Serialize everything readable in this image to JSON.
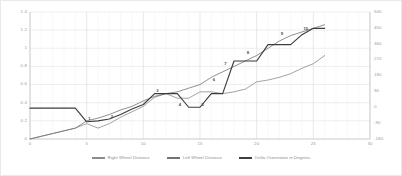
{
  "chart_data": {
    "type": "line",
    "title": "",
    "xlabel": "",
    "ylabel": "",
    "grid": true,
    "legend_position": "bottom",
    "xlim": [
      0,
      30
    ],
    "ylim": [
      0,
      1.4
    ],
    "y2lim": [
      -180,
      540
    ],
    "x_ticks": [
      "0",
      "5",
      "10",
      "15",
      "20",
      "25",
      "30"
    ],
    "y_ticks": [
      "0",
      "0.2",
      "0.4",
      "0.6",
      "0.8",
      "1",
      "1.2",
      "1.4"
    ],
    "y2_ticks": [
      "-180",
      "-90",
      "0",
      "90",
      "180",
      "270",
      "360",
      "450",
      "540"
    ],
    "x": [
      0,
      1,
      2,
      3,
      4,
      5,
      6,
      7,
      8,
      9,
      10,
      11,
      12,
      13,
      14,
      15,
      16,
      17,
      18,
      19,
      20,
      21,
      22,
      23,
      24,
      25,
      26
    ],
    "series": [
      {
        "name": "Right Wheel Distance",
        "color": "#8c8c8c",
        "axis": "left",
        "values": [
          0.0,
          0.03,
          0.06,
          0.09,
          0.12,
          0.17,
          0.12,
          0.17,
          0.24,
          0.3,
          0.36,
          0.46,
          0.5,
          0.45,
          0.45,
          0.52,
          0.52,
          0.5,
          0.52,
          0.55,
          0.63,
          0.65,
          0.68,
          0.72,
          0.78,
          0.83,
          0.92
        ]
      },
      {
        "name": "Left Wheel Distance",
        "color": "#737373",
        "axis": "left",
        "values": [
          0.0,
          0.03,
          0.06,
          0.09,
          0.12,
          0.2,
          0.23,
          0.27,
          0.32,
          0.36,
          0.42,
          0.47,
          0.5,
          0.52,
          0.56,
          0.6,
          0.68,
          0.74,
          0.8,
          0.86,
          0.92,
          1.0,
          1.08,
          1.14,
          1.18,
          1.22,
          1.26
        ]
      },
      {
        "name": "Delta Orientation in Degrees",
        "color": "#3d3d3d",
        "axis": "right",
        "values": [
          0.34,
          0.34,
          0.34,
          0.34,
          0.34,
          0.19,
          0.2,
          0.22,
          0.27,
          0.33,
          0.38,
          0.5,
          0.5,
          0.5,
          0.35,
          0.35,
          0.5,
          0.5,
          0.86,
          0.86,
          0.86,
          1.04,
          1.04,
          1.04,
          1.15,
          1.22,
          1.22
        ]
      }
    ],
    "point_labels": [
      {
        "label": "1",
        "x": 5,
        "y": 0.19,
        "series": "Delta Orientation in Degrees"
      },
      {
        "label": "2",
        "x": 7,
        "y": 0.22,
        "series": "Delta Orientation in Degrees"
      },
      {
        "label": "3",
        "x": 11,
        "y": 0.5,
        "series": "Delta Orientation in Degrees"
      },
      {
        "label": "4",
        "x": 13,
        "y": 0.35,
        "series": "Delta Orientation in Degrees"
      },
      {
        "label": "5",
        "x": 15,
        "y": 0.35,
        "series": "Delta Orientation in Degrees"
      },
      {
        "label": "6",
        "x": 16,
        "y": 0.62,
        "series": "Delta Orientation in Degrees"
      },
      {
        "label": "7",
        "x": 17,
        "y": 0.8,
        "series": "Delta Orientation in Degrees"
      },
      {
        "label": "8",
        "x": 19,
        "y": 0.92,
        "series": "Delta Orientation in Degrees"
      },
      {
        "label": "9",
        "x": 22,
        "y": 1.13,
        "series": "Delta Orientation in Degrees"
      },
      {
        "label": "10",
        "x": 24,
        "y": 1.18,
        "series": "Delta Orientation in Degrees"
      }
    ]
  }
}
